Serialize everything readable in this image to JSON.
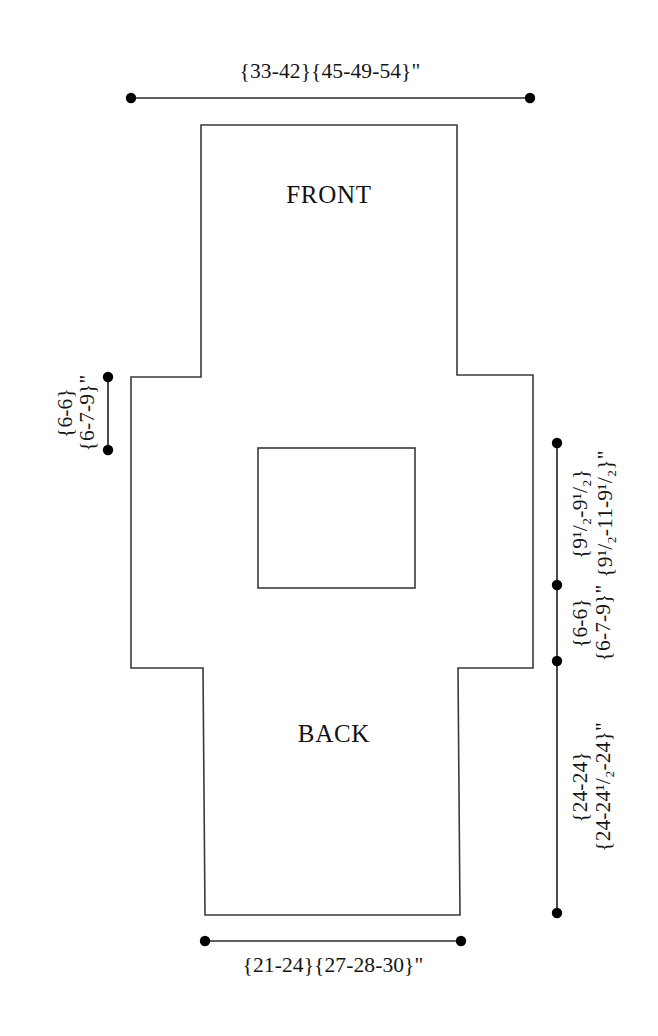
{
  "diagram": {
    "panels": [
      {
        "id": "front",
        "label": "FRONT"
      },
      {
        "id": "back",
        "label": "BACK"
      }
    ],
    "colors": {
      "outline": "#3a3a3a",
      "measure": "#2a2a2a",
      "background": "#ffffff",
      "text": "#141414"
    },
    "dimensions": {
      "top_width": {
        "id": "top-width",
        "text": "{33-42}{45-49-54}\"",
        "position": "top",
        "orientation": "horizontal"
      },
      "bottom_width": {
        "id": "bottom-width",
        "text": "{21-24}{27-28-30}\"",
        "position": "bottom",
        "orientation": "horizontal"
      },
      "left_upper": {
        "id": "left-sleeve-depth-a",
        "text": "{6-6}",
        "position": "left",
        "orientation": "vertical"
      },
      "left_lower": {
        "id": "left-sleeve-depth-b",
        "text": "{6-7-9}\"",
        "position": "left",
        "orientation": "vertical"
      },
      "right_upper_a": {
        "id": "right-upper-a",
        "text": "{9¹/₂-9¹/₂}",
        "position": "right",
        "orientation": "vertical"
      },
      "right_upper_b": {
        "id": "right-upper-b",
        "text": "{9¹/₂-11-9¹/₂}\"",
        "position": "right",
        "orientation": "vertical"
      },
      "right_mid_a": {
        "id": "right-mid-a",
        "text": "{6-6}",
        "position": "right",
        "orientation": "vertical"
      },
      "right_mid_b": {
        "id": "right-mid-b",
        "text": "{6-7-9}\"",
        "position": "right",
        "orientation": "vertical"
      },
      "right_lower_a": {
        "id": "right-lower-a",
        "text": "{24-24}",
        "position": "right",
        "orientation": "vertical"
      },
      "right_lower_b": {
        "id": "right-lower-b",
        "text": "{24-24¹/₂-24}\"",
        "position": "right",
        "orientation": "vertical"
      }
    }
  }
}
